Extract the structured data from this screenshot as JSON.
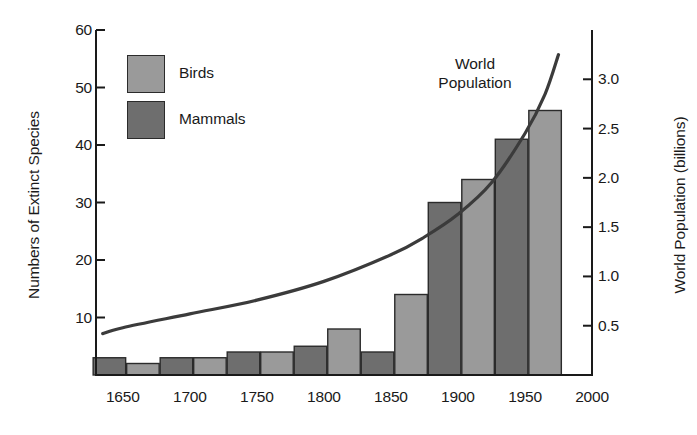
{
  "chart_data": {
    "type": "bar",
    "title": "",
    "subtitle": "",
    "xlabel": "",
    "ylabel": "Numbers of Extinct Species",
    "ylabel_secondary": "World Population (billions)",
    "grid": false,
    "legend_position": "top-left",
    "xlim": [
      1630,
      2000
    ],
    "ylim": [
      0,
      60
    ],
    "ylim_secondary": [
      0,
      3.5
    ],
    "x_ticks": [
      1650,
      1700,
      1750,
      1800,
      1850,
      1900,
      1950,
      2000
    ],
    "x_tick_labels": [
      "1650",
      "1700",
      "1750",
      "1800",
      "1850",
      "1900",
      "1950",
      "2000"
    ],
    "y_ticks": [
      10,
      20,
      30,
      40,
      50,
      60
    ],
    "y_tick_labels": [
      "10",
      "20",
      "30",
      "40",
      "50",
      "60"
    ],
    "y_ticks_secondary": [
      0.5,
      1.0,
      1.5,
      2.0,
      2.5,
      3.0
    ],
    "y_tick_labels_secondary": [
      "0.5",
      "1.0",
      "1.5",
      "2.0",
      "2.5",
      "3.0"
    ],
    "bar_interval_years": 25,
    "categories": [
      "1640",
      "1665",
      "1690",
      "1715",
      "1740",
      "1765",
      "1790",
      "1815",
      "1840",
      "1865",
      "1890",
      "1915",
      "1940",
      "1965"
    ],
    "series": [
      {
        "name": "Mammals",
        "color": "#6e6e6e",
        "values": [
          3,
          null,
          3,
          null,
          4,
          null,
          5,
          null,
          4,
          null,
          30,
          null,
          41,
          null
        ]
      },
      {
        "name": "Birds",
        "color": "#9a9a9a",
        "values": [
          null,
          2,
          null,
          3,
          null,
          4,
          null,
          8,
          null,
          14,
          null,
          34,
          null,
          46
        ]
      }
    ],
    "bars": [
      {
        "x": 1640,
        "value": 3,
        "series": "Mammals"
      },
      {
        "x": 1665,
        "value": 2,
        "series": "Birds"
      },
      {
        "x": 1690,
        "value": 3,
        "series": "Mammals"
      },
      {
        "x": 1715,
        "value": 3,
        "series": "Birds"
      },
      {
        "x": 1740,
        "value": 4,
        "series": "Mammals"
      },
      {
        "x": 1765,
        "value": 4,
        "series": "Birds"
      },
      {
        "x": 1790,
        "value": 5,
        "series": "Mammals"
      },
      {
        "x": 1815,
        "value": 8,
        "series": "Birds"
      },
      {
        "x": 1840,
        "value": 4,
        "series": "Mammals"
      },
      {
        "x": 1865,
        "value": 14,
        "series": "Birds"
      },
      {
        "x": 1890,
        "value": 30,
        "series": "Mammals"
      },
      {
        "x": 1915,
        "value": 34,
        "series": "Birds"
      },
      {
        "x": 1940,
        "value": 41,
        "series": "Mammals"
      },
      {
        "x": 1965,
        "value": 46,
        "series": "Birds"
      }
    ],
    "overlay_line": {
      "name": "World Population",
      "color": "#3b3b3b",
      "axis": "secondary",
      "unit": "billions",
      "points": [
        {
          "x": 1635,
          "y": 0.42
        },
        {
          "x": 1650,
          "y": 0.48
        },
        {
          "x": 1700,
          "y": 0.62
        },
        {
          "x": 1750,
          "y": 0.76
        },
        {
          "x": 1800,
          "y": 0.95
        },
        {
          "x": 1850,
          "y": 1.22
        },
        {
          "x": 1875,
          "y": 1.4
        },
        {
          "x": 1900,
          "y": 1.63
        },
        {
          "x": 1925,
          "y": 1.95
        },
        {
          "x": 1950,
          "y": 2.45
        },
        {
          "x": 1965,
          "y": 2.85
        },
        {
          "x": 1975,
          "y": 3.25
        }
      ]
    },
    "annotations": [
      {
        "name": "world-population-label",
        "line1": "World",
        "line2": "Population"
      }
    ]
  },
  "legend": {
    "items": [
      {
        "label": "Birds",
        "color": "#9a9a9a"
      },
      {
        "label": "Mammals",
        "color": "#6e6e6e"
      }
    ]
  },
  "colors": {
    "birds": "#9a9a9a",
    "mammals": "#6e6e6e",
    "axis": "#1a1a1a",
    "curve": "#3b3b3b",
    "background": "#ffffff"
  }
}
